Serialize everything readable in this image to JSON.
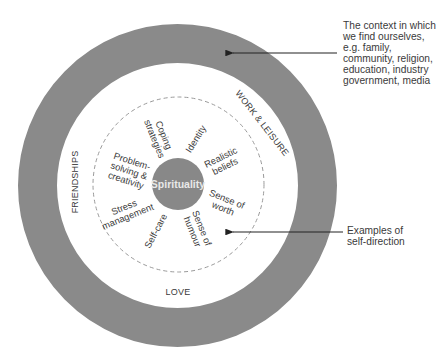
{
  "diagram": {
    "colors": {
      "outer_ring": "#8a8a8a",
      "center_circle": "#888888",
      "dashed_circle": "#9a9a9a",
      "arrow": "#222222",
      "text": "#3a3a3a",
      "center_text": "#eeeeee"
    },
    "center": {
      "label": "Spirituality"
    },
    "ring_labels": {
      "top_right": "WORK & LEISURE",
      "left": "FRIENDSHIPS",
      "bottom": "LOVE"
    },
    "self_direction_items": [
      {
        "id": "coping",
        "label": "Coping\nstrategies"
      },
      {
        "id": "identity",
        "label": "Identity"
      },
      {
        "id": "realistic",
        "label": "Realistic\nbeliefs"
      },
      {
        "id": "worth",
        "label": "Sense of\nworth"
      },
      {
        "id": "humour",
        "label": "Sense of\nhumour"
      },
      {
        "id": "selfcare",
        "label": "Self-care"
      },
      {
        "id": "stress",
        "label": "Stress\nmanagement"
      },
      {
        "id": "problem",
        "label": "Problem-\nsolving &\ncreativity"
      }
    ],
    "annotations": {
      "context": "The context in which\nwe find ourselves,\ne.g. family,\ncommunity, religion,\neducation, industry\ngovernment, media",
      "self_direction": "Examples of\nself-direction"
    }
  }
}
